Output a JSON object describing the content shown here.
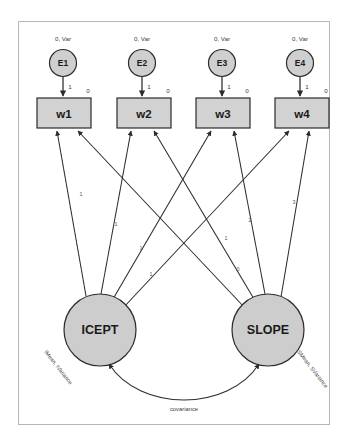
{
  "diagram": {
    "type": "latent-growth-curve-path-diagram",
    "frame": {
      "border_color": "#b7b7b7",
      "background": "#ffffff"
    },
    "palette": {
      "shape_fill": "#d2d2d2",
      "circle_fill": "#cfcfcf",
      "stroke": "#2b2b2b",
      "text": "#1a1a1a"
    },
    "error_terms": [
      {
        "name": "E1",
        "label": "E1",
        "annotation": "0, Var",
        "loading": "1",
        "cx": 63,
        "cy": 63
      },
      {
        "name": "E2",
        "label": "E2",
        "annotation": "0, Var",
        "loading": "1",
        "cx": 142,
        "cy": 63
      },
      {
        "name": "E3",
        "label": "E3",
        "annotation": "0, Var",
        "loading": "1",
        "cx": 222,
        "cy": 63
      },
      {
        "name": "E4",
        "label": "E4",
        "annotation": "0, Var",
        "loading": "1",
        "cx": 300,
        "cy": 63
      }
    ],
    "observed": [
      {
        "name": "w1",
        "label": "w1",
        "intercept": "0",
        "x": 37,
        "y": 98,
        "w": 54,
        "h": 30
      },
      {
        "name": "w2",
        "label": "w2",
        "intercept": "0",
        "x": 117,
        "y": 98,
        "w": 54,
        "h": 30
      },
      {
        "name": "w3",
        "label": "w3",
        "intercept": "0",
        "x": 196,
        "y": 98,
        "w": 54,
        "h": 30
      },
      {
        "name": "w4",
        "label": "w4",
        "intercept": "0",
        "x": 275,
        "y": 98,
        "w": 54,
        "h": 30
      }
    ],
    "factors": [
      {
        "name": "ICEPT",
        "label": "ICEPT",
        "annotation": "IMean, IVariance",
        "cx": 100,
        "cy": 330,
        "r": 36
      },
      {
        "name": "SLOPE",
        "label": "SLOPE",
        "annotation": "SMean, SVariance",
        "cx": 268,
        "cy": 330,
        "r": 36
      }
    ],
    "icept_loadings": [
      {
        "target": "w1",
        "value": "1"
      },
      {
        "target": "w2",
        "value": "1"
      },
      {
        "target": "w3",
        "value": "1"
      },
      {
        "target": "w4",
        "value": "1"
      }
    ],
    "slope_loadings": [
      {
        "target": "w1",
        "value": "0"
      },
      {
        "target": "w2",
        "value": "1"
      },
      {
        "target": "w3",
        "value": "2"
      },
      {
        "target": "w4",
        "value": "3"
      }
    ],
    "covariance": {
      "label": "covariance",
      "from": "ICEPT",
      "to": "SLOPE"
    }
  }
}
